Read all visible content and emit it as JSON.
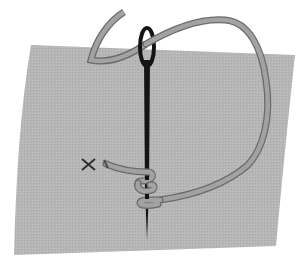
{
  "diagram": {
    "elements": [
      {
        "name": "fabric",
        "color": "#b4b4b4"
      },
      {
        "name": "needle",
        "color": "#141414"
      },
      {
        "name": "thread",
        "color": "#9a9a9a",
        "outline": "#6e6e6e"
      },
      {
        "name": "thread-wraps",
        "count": 2
      },
      {
        "name": "x-marker",
        "label": "×"
      }
    ]
  },
  "labels": {
    "marker": "×"
  },
  "colors": {
    "background": "#ffffff",
    "fabric": "#b4b4b4",
    "needle": "#141414",
    "thread": "#a0a0a0",
    "thread_outline": "#6a6a6a"
  }
}
